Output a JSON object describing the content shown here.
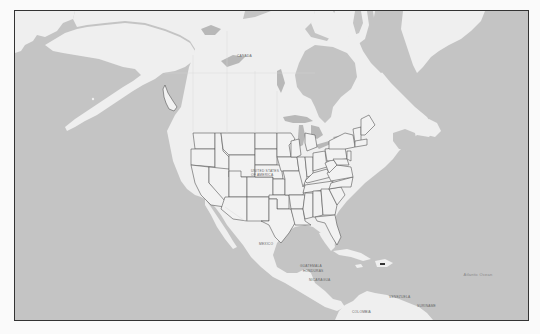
{
  "map": {
    "type": "region-map",
    "region": "North America",
    "colors": {
      "water": "#c4c4c4",
      "land": "#efefef",
      "state_fill": "#f2f2f2",
      "state_border": "#555555",
      "frame_border": "#333333",
      "page_background": "#fafafa"
    },
    "highlighted_regions": [
      "United States (contiguous states with state borders)",
      "Southeast Alaska panhandle outline"
    ],
    "labels": {
      "canada": "Canada",
      "usa_line1": "United States",
      "usa_line2": "of America",
      "mexico": "Mexico",
      "cuba": "",
      "guatemala": "Guatemala",
      "honduras": "Honduras",
      "nicaragua": "Nicaragua",
      "venezuela": "Venezuela",
      "colombia": "Colombia",
      "suriname": "Suriname",
      "atlantic_ocean": "Atlantic Ocean"
    },
    "markers": [
      {
        "name": "puerto-rico-marker",
        "label": "PR"
      }
    ]
  }
}
